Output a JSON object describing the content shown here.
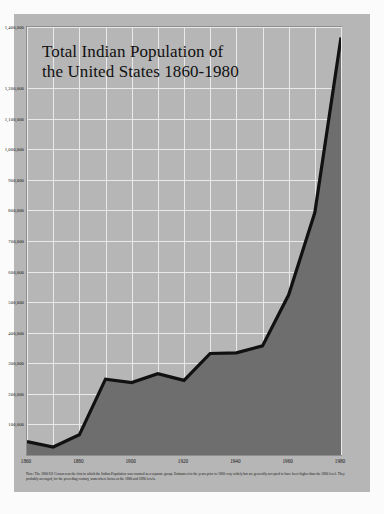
{
  "title": "Total Indian Population of the United States 1860-1980",
  "title_line1": "Total Indian Population of",
  "title_line2": "the United States 1860-1980",
  "note": "Note: The 1860 US Census was the first in which the Indian Population was counted as a separate group. Estimates for the years prior to 1860 very widely but are generally accepted to have been higher than the 1860 level. They probably averaged, for the preceding century, somewhere between the 1880 and 1890 levels.",
  "colors": {
    "card_background": "#b6b6b6",
    "plot_background": "#b6b6b6",
    "gridline": "#e9e9e9",
    "area_fill": "#6e6e6e",
    "line": "#111111",
    "text": "#141414",
    "page_background": "#fbfbfb"
  },
  "chart_data": {
    "type": "area",
    "title": "Total Indian Population of the United States 1860-1980",
    "xlabel": "",
    "ylabel": "",
    "grid": true,
    "legend": null,
    "xlim": [
      1860,
      1980
    ],
    "ylim": [
      0,
      1400000
    ],
    "x": [
      1860,
      1870,
      1880,
      1890,
      1900,
      1910,
      1920,
      1930,
      1940,
      1950,
      1960,
      1970,
      1980
    ],
    "values": [
      44000,
      26000,
      66000,
      248000,
      237000,
      266000,
      244000,
      332000,
      334000,
      357000,
      524000,
      793000,
      1366000
    ],
    "xticks": [
      1860,
      1880,
      1900,
      1920,
      1940,
      1960,
      1980
    ],
    "xticklabels": [
      "1860",
      "1880",
      "1900",
      "1920",
      "1940",
      "1960",
      "1980"
    ],
    "yticks": [
      100000,
      200000,
      300000,
      400000,
      500000,
      600000,
      700000,
      800000,
      900000,
      1000000,
      1100000,
      1200000,
      1400000
    ],
    "yticklabels": [
      "100,000",
      "200,000",
      "300,000",
      "400,000",
      "500,000",
      "600,000",
      "700,000",
      "800,000",
      "900,000",
      "1,000,000",
      "1,100,000",
      "1,200,000",
      "1,400,000"
    ]
  }
}
